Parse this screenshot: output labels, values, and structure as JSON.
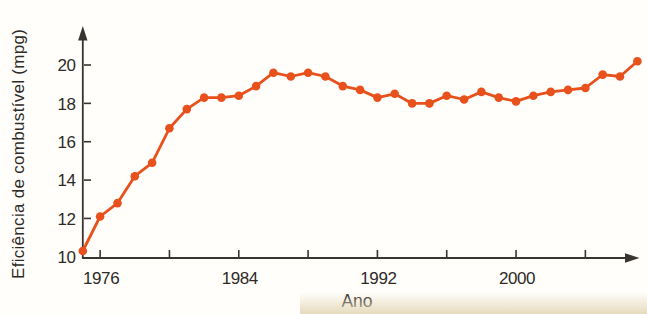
{
  "figure": {
    "kind": "textbook-scan",
    "background": "#fffefb",
    "page_edge_color": "#141414",
    "paper_shadow_color": "#e4d7b8"
  },
  "chart_data": {
    "type": "line",
    "title": "",
    "xlabel": "Ano",
    "ylabel": "Eficiência de combustível (mpg)",
    "x": [
      1975,
      1976,
      1977,
      1978,
      1979,
      1980,
      1981,
      1982,
      1983,
      1984,
      1985,
      1986,
      1987,
      1988,
      1989,
      1990,
      1991,
      1992,
      1993,
      1994,
      1995,
      1996,
      1997,
      1998,
      1999,
      2000,
      2001,
      2002,
      2003,
      2004,
      2005,
      2006,
      2007
    ],
    "values": [
      10.3,
      12.1,
      12.8,
      14.2,
      14.9,
      16.7,
      17.7,
      18.3,
      18.3,
      18.4,
      18.9,
      19.6,
      19.4,
      19.6,
      19.4,
      18.9,
      18.7,
      18.3,
      18.5,
      18.0,
      18.0,
      18.4,
      18.2,
      18.6,
      18.3,
      18.1,
      18.4,
      18.6,
      18.7,
      18.8,
      19.5,
      19.4,
      20.2
    ],
    "series_name": "Eficiência de combustível",
    "xlim": [
      1975,
      2007.5
    ],
    "ylim": [
      10,
      21.5
    ],
    "x_ticks": [
      1976,
      1980,
      1984,
      1988,
      1992,
      1996,
      2000,
      2004
    ],
    "x_tick_labeled": [
      1976,
      1984,
      1992,
      2000
    ],
    "y_ticks": [
      10,
      12,
      14,
      16,
      18,
      20
    ],
    "y_ticks_with_marks": [
      12,
      14,
      16,
      18,
      20
    ],
    "grid": false,
    "legend_position": "none",
    "marker": "circle",
    "line_color": "#e8511c",
    "axis_color": "#38342f",
    "text_color": "#2e2a26",
    "axes_have_arrowheads": true
  }
}
